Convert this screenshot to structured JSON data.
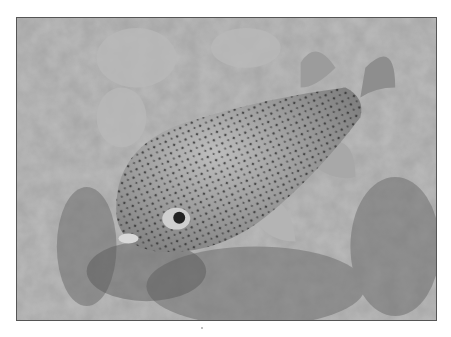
{
  "image": {
    "subject": "porcupinefish over coral reef",
    "style": "grayscale photograph",
    "frame_color": "#555555",
    "background_color": "#ffffff"
  }
}
